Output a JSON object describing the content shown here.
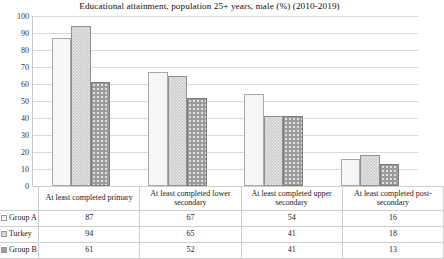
{
  "chart_data": {
    "type": "bar",
    "title": "Educational attainment, population 25+ years, male (%) (2010-2019)",
    "xlabel": "",
    "ylabel": "",
    "ylim": [
      0,
      100
    ],
    "ytick_step": 10,
    "yticks": [
      100,
      90,
      80,
      70,
      60,
      50,
      40,
      30,
      20,
      10,
      0
    ],
    "grid": true,
    "legend_position": "data-table-left",
    "categories": [
      "At least completed primary",
      "At least completed lower secondary",
      "At least completed upper secondary",
      "At least completed post-secondary"
    ],
    "series": [
      {
        "name": "Group A",
        "values": [
          87,
          67,
          54,
          16
        ]
      },
      {
        "name": "Turkey",
        "values": [
          94,
          65,
          41,
          18
        ]
      },
      {
        "name": "Group B",
        "values": [
          61,
          52,
          41,
          13
        ]
      }
    ]
  },
  "table": {
    "corner_label": "",
    "column_headers": [
      "At least completed primary",
      "At least completed lower secondary",
      "At least completed upper secondary",
      "At least completed post-secondary"
    ],
    "rows": [
      {
        "label": "Group A",
        "values": [
          "87",
          "67",
          "54",
          "16"
        ]
      },
      {
        "label": "Turkey",
        "values": [
          "94",
          "65",
          "41",
          "18"
        ]
      },
      {
        "label": "Group B",
        "values": [
          "61",
          "52",
          "41",
          "13"
        ]
      }
    ]
  },
  "colors": {
    "series_a": "#f7f7f7",
    "series_turkey": "#cfcfcf",
    "series_b": "#9b9b9b",
    "gridline": "#d9d9d9",
    "text": "#1a1a1a"
  }
}
